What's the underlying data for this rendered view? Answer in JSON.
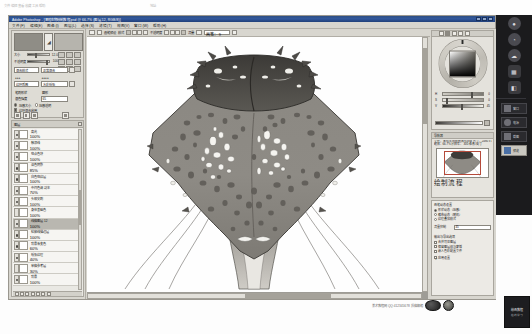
{
  "desktop": {
    "strip_text": "文件  编辑  查看  收藏  工具  帮助",
    "strip_right": "地址"
  },
  "window": {
    "title": "Adobe Photoshop - [黑暗生物绘制教程.psd @ 66.7% (图层 12, RGB/8)]",
    "buttons": [
      "minimize",
      "maximize",
      "close"
    ]
  },
  "menubar": {
    "items": [
      "文件(F)",
      "编辑(E)",
      "图像(I)",
      "图层(L)",
      "选择(S)",
      "滤镜(T)",
      "视图(V)",
      "窗口(W)",
      "帮助(H)"
    ]
  },
  "options_bar": {
    "tool_icon": "brush-icon",
    "preset_label": "画笔预设",
    "mode_label": "模式",
    "blend_cells": [
      "normal",
      "multiply",
      "screen",
      "overlay"
    ],
    "opacity_label": "不透明度",
    "opacity_cells": [
      "25%",
      "50%",
      "75%",
      "100%"
    ],
    "flow_label": "流量",
    "airbrush_label": "喷枪",
    "size_value": "画笔： 9",
    "tablet_icon": "tablet-pressure-icon"
  },
  "tool_panel": {
    "foreground_swatch": "#8f8d86",
    "background_swatch": "#b6b4ad",
    "center_icon": "eyedropper-icon",
    "sliders": [
      {
        "label": "大小",
        "value": "12.0",
        "pos": 38
      },
      {
        "label": "不透明度",
        "value": "100",
        "pos": 92
      }
    ],
    "fields": [
      {
        "label": "混合模式",
        "value": "正常混合"
      },
      {
        "label": "纹理质感",
        "value": "水彩纸张"
      },
      {
        "label": "笔刷形状",
        "value": "圆形"
      },
      {
        "label": "混色强度",
        "value": "65"
      }
    ],
    "checks": [
      {
        "label": "压感大小",
        "on": true
      },
      {
        "label": "压感透明",
        "on": false
      },
      {
        "label": "纹理混合启用",
        "on": true
      }
    ],
    "tool_icons": [
      "new-icon",
      "copy-icon",
      "delete-icon",
      "folder-icon",
      "mask-icon",
      "fx-icon"
    ]
  },
  "layers_panel": {
    "title": "图层",
    "close_icon": "close-icon",
    "rows": [
      {
        "name": "高光",
        "opacity": "100%",
        "visible": true,
        "selected": false
      },
      {
        "name": "触须线",
        "opacity": "100%",
        "visible": true,
        "selected": false
      },
      {
        "name": "斑点色块",
        "opacity": "100%",
        "visible": true,
        "selected": false
      },
      {
        "name": "深色阴影",
        "opacity": "85%",
        "visible": true,
        "selected": false
      },
      {
        "name": "白色斑纹层",
        "opacity": "100%",
        "visible": true,
        "selected": false
      },
      {
        "name": "中间色调 副本",
        "opacity": "70%",
        "visible": true,
        "selected": false
      },
      {
        "name": "头部尖刺",
        "opacity": "100%",
        "visible": true,
        "selected": false
      },
      {
        "name": "身体基础色",
        "opacity": "100%",
        "visible": false,
        "selected": false
      },
      {
        "name": "线稿图层 12",
        "opacity": "100%",
        "visible": true,
        "selected": true
      },
      {
        "name": "轮廓线描边层",
        "opacity": "100%",
        "visible": true,
        "selected": false
      },
      {
        "name": "背景渐变色",
        "opacity": "60%",
        "visible": true,
        "selected": false
      },
      {
        "name": "纸张纹理",
        "opacity": "40%",
        "visible": true,
        "selected": false
      },
      {
        "name": "草稿参考层",
        "opacity": "30%",
        "visible": false,
        "selected": false
      },
      {
        "name": "背景",
        "opacity": "100%",
        "visible": true,
        "selected": false
      }
    ],
    "footer_icons": [
      "link-icon",
      "fx-icon",
      "mask-icon",
      "group-icon",
      "adjust-icon",
      "new-layer-icon",
      "trash-icon"
    ]
  },
  "color_panel": {
    "tabs": [
      "color-tab",
      "swatches-tab",
      "styles-tab",
      "history-tab",
      "brush-tab"
    ],
    "active_tab_index": 1,
    "wheel_icon": "color-wheel-icon",
    "sliders": [
      {
        "label": "H",
        "value": "0",
        "pos": 70
      },
      {
        "label": "S",
        "value": "0",
        "pos": 8
      },
      {
        "label": "V",
        "value": "45",
        "pos": 45
      },
      {
        "label": "A",
        "value": "100",
        "pos": 62
      }
    ],
    "gradient_bar": "value-gradient",
    "picker_icon": "eyedropper-icon"
  },
  "navigator_panel": {
    "title": "导航器",
    "info_line1": "文件：黑暗生物绘制教程.psd   尺寸：2480 x 3508",
    "info_line2": "缩放：66.7%   分辨率：300 像素/英寸",
    "thumbnail": "artwork-thumbnail",
    "overlay_text": "绘制流程"
  },
  "settings_panel": {
    "group1_title": "画笔动态设置",
    "group1_options": [
      {
        "label": "形状动态（压感）",
        "on": true
      },
      {
        "label": "散布动态（随机）",
        "on": false
      },
      {
        "label": "纹理叠加模式",
        "on": false
      }
    ],
    "field_label": "流量抑制",
    "field_value": "45",
    "group2_title": "输出与导出选项",
    "group2_options": [
      {
        "label": "合并可见图层",
        "on": false
      },
      {
        "label": "保留图层组与蒙版",
        "on": false
      },
      {
        "label": "嵌入色彩配置文件",
        "on": false
      }
    ],
    "apply_label": "应用设置",
    "apply_on": true
  },
  "dock": {
    "items": [
      {
        "icon": "globe-icon",
        "glyph": "●"
      },
      {
        "icon": "pie-icon",
        "glyph": "◔"
      },
      {
        "icon": "cloud-icon",
        "glyph": "☁"
      },
      {
        "icon": "grid-icon",
        "glyph": "▦"
      },
      {
        "icon": "puzzle-icon",
        "glyph": "◧"
      }
    ],
    "buttons": [
      {
        "label": "窗口",
        "icon": "window-icon"
      },
      {
        "label": "电源",
        "icon": "power-icon"
      },
      {
        "label": "截图",
        "icon": "capture-icon"
      },
      {
        "label": "预览",
        "icon": "preview-icon",
        "active": true
      }
    ]
  },
  "watermark": {
    "text": "美术教程网  QQ:412345678  投稿邮箱",
    "logo": "studio-logo",
    "ad_line1": "绘画教程",
    "ad_line2": "在线学习"
  },
  "artwork": {
    "title": "dark-creature-illustration",
    "colors": {
      "body": "#8e8b85",
      "body_dark": "#6e6b66",
      "head_dark": "#4a4845",
      "spot_dark": "#5d5a55",
      "spot_light": "#f2f1ec",
      "outline": "#3a3835",
      "tail": "#9b9892"
    }
  }
}
